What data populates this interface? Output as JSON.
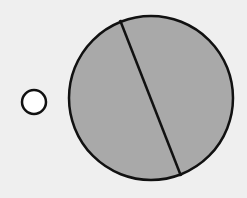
{
  "diagram": {
    "background": "#efefef",
    "stroke_color": "#111111",
    "small_circle": {
      "cx": 34,
      "cy": 102,
      "r": 12,
      "fill": "#ffffff",
      "stroke_width": 2.5
    },
    "large_circle": {
      "cx": 151,
      "cy": 98,
      "r": 82,
      "fill": "#a9a9a9",
      "stroke_width": 2.5
    },
    "chord": {
      "x1": 120,
      "y1": 20,
      "x2": 181,
      "y2": 176,
      "stroke_width": 2.5
    }
  }
}
